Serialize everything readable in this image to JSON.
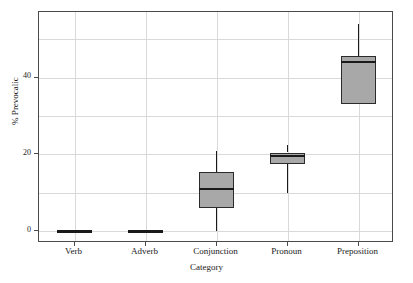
{
  "chart_data": {
    "type": "box",
    "title": "",
    "xlabel": "Category",
    "ylabel": "% Prevocalic",
    "categories": [
      "Verb",
      "Adverb",
      "Conjunction",
      "Pronoun",
      "Preposition"
    ],
    "ylim": [
      -3,
      57
    ],
    "yticks": [
      0,
      20,
      40
    ],
    "ytick_labels": [
      "0",
      "20",
      "40"
    ],
    "y_gridlines": [
      0,
      10,
      20,
      30,
      40,
      50
    ],
    "grid": true,
    "legend": "none",
    "boxes": [
      {
        "category": "Verb",
        "min": 0,
        "q1": 0,
        "median": 0,
        "q3": 0,
        "max": 0,
        "degenerate": true
      },
      {
        "category": "Adverb",
        "min": 0,
        "q1": 0,
        "median": 0,
        "q3": 0,
        "max": 0,
        "degenerate": true
      },
      {
        "category": "Conjunction",
        "min": 0,
        "q1": 6,
        "median": 11,
        "q3": 15.5,
        "max": 21,
        "degenerate": false
      },
      {
        "category": "Pronoun",
        "min": 10,
        "q1": 17.5,
        "median": 19.5,
        "q3": 20.5,
        "max": 22.5,
        "degenerate": false
      },
      {
        "category": "Preposition",
        "min": 33,
        "q1": 33,
        "median": 44,
        "q3": 45.5,
        "max": 54,
        "degenerate": false
      }
    ],
    "colors": {
      "box_fill": "#a8a8a8",
      "box_edge": "#2b2b2b",
      "median": "#1a1a1a",
      "whisker": "#1a1a1a",
      "grid": "#d9d9d9",
      "frame": "#4a4a4a",
      "background": "#ffffff",
      "text": "#1a1a1a"
    }
  }
}
